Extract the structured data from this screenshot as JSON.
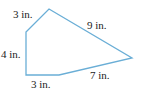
{
  "figure": {
    "stroke_color": "#6aaed6",
    "vertices": [
      [
        26,
        32
      ],
      [
        49,
        9
      ],
      [
        132,
        58
      ],
      [
        59,
        75
      ],
      [
        26,
        75
      ]
    ],
    "labels": {
      "top_left_side": "3 in.",
      "top_right_side": "9 in.",
      "left_side": "4 in.",
      "bottom_side": "3 in.",
      "bottom_right_side": "7 in."
    }
  }
}
